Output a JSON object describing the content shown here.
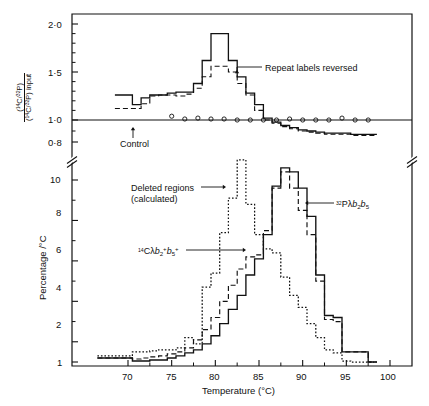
{
  "figure": {
    "background_color": "#ffffff",
    "line_color": "#111111"
  },
  "top_panel": {
    "y_axis": {
      "label_numerator": "(14C/32P)",
      "label_denominator": "(14C/32P) input",
      "label_plain": "(14C/32P) / (14C/32P) input",
      "ticks": [
        "2·0",
        "1·5",
        "1·0",
        "0·8"
      ],
      "tick_values": [
        2.0,
        1.5,
        1.0,
        0.8
      ],
      "has_axis_break": true
    },
    "annotations": [
      {
        "id": "repeat-labels-reversed",
        "text": "Repeat labels reversed"
      },
      {
        "id": "control",
        "text": "Control"
      }
    ]
  },
  "bottom_panel": {
    "y_axis": {
      "label": "Percentage /°C",
      "ticks": [
        "10",
        "8",
        "6",
        "4",
        "2",
        "1"
      ],
      "tick_values": [
        10,
        8,
        6,
        4,
        2,
        1
      ]
    },
    "x_axis": {
      "label": "Temperature (°C)",
      "ticks": [
        "70",
        "75",
        "80",
        "85",
        "90",
        "95",
        "100"
      ],
      "tick_values": [
        70,
        75,
        80,
        85,
        90,
        95,
        100
      ]
    },
    "annotations": [
      {
        "id": "deleted-regions",
        "line1": "Deleted regions",
        "line2": "(calculated)"
      },
      {
        "id": "c14-lambda",
        "text": "14Cλb2+b5+"
      },
      {
        "id": "p32-lambda",
        "text": "32Pλb2b5"
      }
    ]
  },
  "chart_data": {
    "type": "line",
    "xlabel": "Temperature (°C)",
    "panels": [
      {
        "name": "top",
        "ylabel": "(14C/32P) / (14C/32P) input",
        "ylim": [
          0.8,
          2.15
        ],
        "xlim": [
          66,
          101
        ],
        "grid": false,
        "yticks": [
          0.8,
          1.0,
          1.5,
          2.0
        ],
        "xticks": [
          70,
          75,
          80,
          85,
          90,
          95,
          100
        ],
        "axis_break_y": true,
        "series": [
          {
            "name": "Repeat labels (solid step)",
            "style": "solid-step",
            "x": [
              69,
              70,
              71,
              72,
              73,
              74,
              75,
              76,
              77,
              78,
              79,
              80,
              81,
              82,
              83,
              84,
              85,
              86,
              87,
              88,
              89,
              90,
              91,
              92,
              93,
              94,
              95,
              96,
              97,
              98
            ],
            "y": [
              1.26,
              1.26,
              1.16,
              1.23,
              1.26,
              1.26,
              1.28,
              1.29,
              1.29,
              1.38,
              1.62,
              1.9,
              1.9,
              1.62,
              1.45,
              1.28,
              1.16,
              1.02,
              0.98,
              0.95,
              0.93,
              0.91,
              0.9,
              0.89,
              0.88,
              0.88,
              0.88,
              0.87,
              0.87,
              0.87
            ]
          },
          {
            "name": "Repeat labels reversed (dashed step)",
            "style": "dashed-step",
            "x": [
              69,
              70,
              71,
              72,
              73,
              74,
              75,
              76,
              77,
              78,
              79,
              80,
              81,
              82,
              83,
              84,
              85,
              86,
              87,
              88,
              89,
              90,
              91,
              92,
              93,
              94,
              95,
              96,
              97,
              98
            ],
            "y": [
              1.12,
              1.12,
              1.12,
              1.17,
              1.25,
              1.26,
              1.26,
              1.25,
              1.27,
              1.33,
              1.45,
              1.56,
              1.56,
              1.5,
              1.38,
              1.26,
              1.1,
              1.0,
              0.97,
              0.94,
              0.92,
              0.9,
              0.89,
              0.88,
              0.87,
              0.87,
              0.87,
              0.86,
              0.86,
              0.86
            ]
          },
          {
            "name": "Control",
            "style": "open-circles",
            "x": [
              75,
              76.5,
              78,
              79.5,
              81,
              82.5,
              84,
              85.5,
              87,
              88.5,
              90,
              91.5,
              93,
              94.5,
              96,
              97.5
            ],
            "y": [
              1.04,
              1.01,
              1.02,
              1.01,
              1.01,
              1.0,
              1.0,
              1.0,
              1.0,
              1.01,
              1.0,
              1.0,
              1.0,
              1.02,
              1.0,
              1.0
            ]
          }
        ]
      },
      {
        "name": "bottom",
        "ylabel": "Percentage /°C",
        "ylim": [
          1,
          11
        ],
        "xlim": [
          66,
          101
        ],
        "grid": false,
        "yticks": [
          1,
          2,
          4,
          6,
          8,
          10
        ],
        "xticks": [
          70,
          75,
          80,
          85,
          90,
          95,
          100
        ],
        "series": [
          {
            "name": "32Pλb2b5",
            "style": "solid-step",
            "x": [
              67,
              68,
              69,
              70,
              71,
              72,
              73,
              74,
              75,
              76,
              77,
              78,
              79,
              80,
              81,
              82,
              83,
              84,
              85,
              86,
              87,
              88,
              89,
              90,
              91,
              92,
              93,
              94,
              95,
              96,
              97,
              98
            ],
            "y": [
              1.2,
              1.2,
              1.2,
              1.2,
              1.05,
              1.05,
              1.1,
              1.1,
              1.2,
              1.3,
              1.45,
              1.6,
              1.9,
              2.3,
              2.9,
              3.6,
              4.3,
              5.3,
              6.1,
              7.3,
              9.7,
              10.6,
              10.4,
              9.6,
              8.2,
              5.3,
              3.3,
              3.2,
              1.5,
              1.5,
              1.5,
              1.0
            ]
          },
          {
            "name": "14Cλb2+b5+",
            "style": "dashed-step",
            "x": [
              67,
              68,
              69,
              70,
              71,
              72,
              73,
              74,
              75,
              76,
              77,
              78,
              79,
              80,
              81,
              82,
              83,
              84,
              85,
              86,
              87,
              88,
              89,
              90,
              91,
              92,
              93,
              94,
              95,
              96,
              97,
              98
            ],
            "y": [
              1.2,
              1.2,
              1.2,
              1.2,
              1.15,
              1.2,
              1.25,
              1.3,
              1.4,
              1.5,
              1.7,
              2.1,
              2.6,
              3.2,
              4.0,
              4.8,
              5.6,
              6.2,
              6.3,
              7.5,
              9.6,
              10.4,
              9.6,
              8.5,
              7.3,
              5.0,
              3.1,
              3.0,
              1.5,
              1.5,
              1.5,
              1.0
            ]
          },
          {
            "name": "Deleted regions (calculated)",
            "style": "dotted-step",
            "x": [
              67,
              68,
              69,
              70,
              71,
              72,
              73,
              74,
              75,
              76,
              77,
              78,
              79,
              80,
              81,
              82,
              83,
              84,
              85,
              86,
              87,
              88,
              89,
              90,
              91,
              92,
              93,
              94,
              95,
              96,
              97,
              98
            ],
            "y": [
              1.3,
              1.3,
              1.3,
              1.3,
              1.5,
              1.5,
              1.55,
              1.6,
              1.6,
              1.7,
              2.2,
              1.9,
              4.7,
              5.4,
              7.4,
              9.1,
              11.0,
              8.8,
              7.3,
              6.6,
              6.4,
              5.2,
              4.3,
              3.7,
              2.9,
              2.2,
              1.6,
              1.45,
              1.05,
              1.0,
              1.0,
              1.0
            ]
          }
        ]
      }
    ]
  }
}
